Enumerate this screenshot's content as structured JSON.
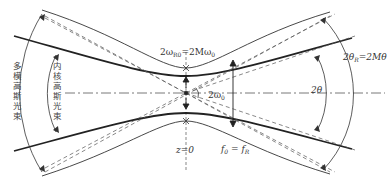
{
  "diagram": {
    "type": "gaussian-beam-propagation",
    "labels": {
      "embedded_waist": "2ω",
      "embedded_waist_sub": "R0",
      "embedded_waist_eq": "=2Mω",
      "embedded_waist_eq_sub": "0",
      "fundamental_waist": "2ω",
      "fundamental_waist_sub": "0",
      "z_origin": "z=0",
      "focus": "f",
      "focus_sub0": "0",
      "focus_eq": " = f",
      "focus_subR": "R",
      "divergence_fundamental": "2θ",
      "divergence_multimode": "2θ",
      "divergence_multimode_sub": "R",
      "divergence_multimode_eq": "=2Mθ",
      "inner_beam": "内核高斯光束",
      "outer_beam": "多模高斯光束"
    },
    "colors": {
      "line": "#333333",
      "thick_line": "#222222",
      "dashed": "#555555",
      "text": "#333333"
    }
  }
}
